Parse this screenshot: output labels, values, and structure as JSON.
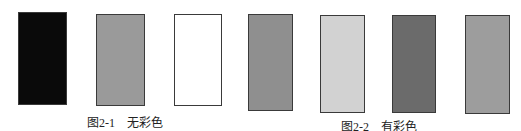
{
  "figures": [
    {
      "number": "图2-1",
      "title": "无彩色",
      "swatches": [
        {
          "name": "black",
          "color": "#0a0a0a"
        },
        {
          "name": "gray",
          "color": "#9a9a9a"
        },
        {
          "name": "white",
          "color": "#ffffff"
        }
      ]
    },
    {
      "number": "图2-2",
      "title": "有彩色",
      "swatches": [
        {
          "name": "medium-gray",
          "color": "#8f8f8f"
        },
        {
          "name": "light-gray",
          "color": "#d2d2d2"
        },
        {
          "name": "dark-gray",
          "color": "#6b6b6b"
        },
        {
          "name": "gray",
          "color": "#9d9d9d"
        }
      ]
    }
  ]
}
